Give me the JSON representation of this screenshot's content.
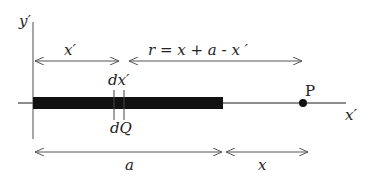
{
  "diagram": {
    "axes": {
      "y_label": "y′",
      "x_label": "x′"
    },
    "top_dimensions": {
      "x_prime": "x′",
      "r_expr": "r = x + a - x ′"
    },
    "element": {
      "width_label": "dx′",
      "charge_label": "dQ"
    },
    "point": {
      "label": "P"
    },
    "bottom_dimensions": {
      "a": "a",
      "x": "x"
    },
    "colors": {
      "rod": "#111111",
      "line": "#555555",
      "point": "#111111"
    }
  }
}
